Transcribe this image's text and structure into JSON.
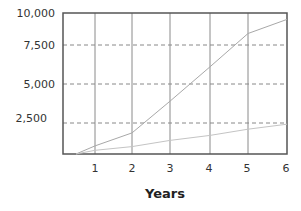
{
  "chart_data": {
    "type": "line",
    "title": "",
    "xlabel": "Years",
    "ylabel": "",
    "x_ticks": [
      "1",
      "2",
      "3",
      "4",
      "5",
      "6"
    ],
    "y_ticks": [
      "2,500",
      "5,000",
      "7,500",
      "10,000"
    ],
    "ylim": [
      0,
      10000
    ],
    "xlim": [
      0,
      6
    ],
    "grid": {
      "vertical": "solid",
      "horizontal": "dashed"
    },
    "legend": null,
    "series": [
      {
        "name": "Upper series",
        "x": [
          0.5,
          1,
          2,
          3,
          4,
          5,
          6
        ],
        "values": [
          0,
          650,
          1700,
          3900,
          6100,
          8400,
          9500
        ],
        "color": "#a8a8a8"
      },
      {
        "name": "Lower series",
        "x": [
          0.5,
          1,
          2,
          3,
          4,
          5,
          6
        ],
        "values": [
          0,
          300,
          600,
          1100,
          1500,
          2000,
          2400
        ],
        "color": "#c0c0c0"
      }
    ]
  },
  "labels": {
    "x_axis_title": "Years",
    "y_ticks": [
      "10,000",
      "7,500",
      "5,000",
      "2,500"
    ],
    "x_ticks": [
      "1",
      "2",
      "3",
      "4",
      "5",
      "6"
    ]
  }
}
